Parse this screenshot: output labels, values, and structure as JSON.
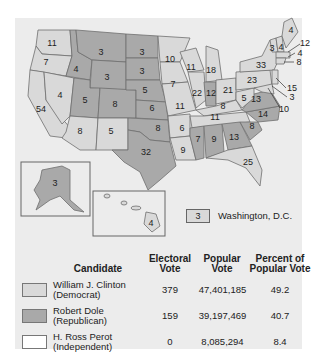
{
  "map": {
    "title": "1996 Presidential Election Electoral Votes",
    "colors": {
      "democrat": "#d9d9d9",
      "republican": "#a9a9a9",
      "independent": "#ffffff",
      "border": "#6e6e6e",
      "background": "#ececec"
    },
    "states": [
      {
        "abbr": "WA",
        "votes": "11",
        "party": "democrat"
      },
      {
        "abbr": "OR",
        "votes": "7",
        "party": "democrat"
      },
      {
        "abbr": "CA",
        "votes": "54",
        "party": "democrat"
      },
      {
        "abbr": "NV",
        "votes": "4",
        "party": "democrat"
      },
      {
        "abbr": "ID",
        "votes": "4",
        "party": "republican"
      },
      {
        "abbr": "MT",
        "votes": "3",
        "party": "republican"
      },
      {
        "abbr": "WY",
        "votes": "3",
        "party": "republican"
      },
      {
        "abbr": "UT",
        "votes": "5",
        "party": "republican"
      },
      {
        "abbr": "CO",
        "votes": "8",
        "party": "republican"
      },
      {
        "abbr": "AZ",
        "votes": "8",
        "party": "democrat"
      },
      {
        "abbr": "NM",
        "votes": "5",
        "party": "democrat"
      },
      {
        "abbr": "ND",
        "votes": "3",
        "party": "republican"
      },
      {
        "abbr": "SD",
        "votes": "3",
        "party": "republican"
      },
      {
        "abbr": "NE",
        "votes": "5",
        "party": "republican"
      },
      {
        "abbr": "KS",
        "votes": "6",
        "party": "republican"
      },
      {
        "abbr": "OK",
        "votes": "8",
        "party": "republican"
      },
      {
        "abbr": "TX",
        "votes": "32",
        "party": "republican"
      },
      {
        "abbr": "MN",
        "votes": "10",
        "party": "democrat"
      },
      {
        "abbr": "IA",
        "votes": "7",
        "party": "democrat"
      },
      {
        "abbr": "MO",
        "votes": "11",
        "party": "democrat"
      },
      {
        "abbr": "AR",
        "votes": "6",
        "party": "democrat"
      },
      {
        "abbr": "LA",
        "votes": "9",
        "party": "democrat"
      },
      {
        "abbr": "WI",
        "votes": "11",
        "party": "democrat"
      },
      {
        "abbr": "IL",
        "votes": "22",
        "party": "democrat"
      },
      {
        "abbr": "MI",
        "votes": "18",
        "party": "democrat"
      },
      {
        "abbr": "IN",
        "votes": "12",
        "party": "republican"
      },
      {
        "abbr": "OH",
        "votes": "21",
        "party": "democrat"
      },
      {
        "abbr": "KY",
        "votes": "8",
        "party": "democrat"
      },
      {
        "abbr": "TN",
        "votes": "11",
        "party": "democrat"
      },
      {
        "abbr": "MS",
        "votes": "7",
        "party": "republican"
      },
      {
        "abbr": "AL",
        "votes": "9",
        "party": "republican"
      },
      {
        "abbr": "GA",
        "votes": "13",
        "party": "republican"
      },
      {
        "abbr": "FL",
        "votes": "25",
        "party": "democrat"
      },
      {
        "abbr": "SC",
        "votes": "8",
        "party": "republican"
      },
      {
        "abbr": "NC",
        "votes": "14",
        "party": "republican"
      },
      {
        "abbr": "VA",
        "votes": "13",
        "party": "republican"
      },
      {
        "abbr": "WV",
        "votes": "5",
        "party": "democrat"
      },
      {
        "abbr": "PA",
        "votes": "23",
        "party": "democrat"
      },
      {
        "abbr": "NY",
        "votes": "33",
        "party": "democrat"
      },
      {
        "abbr": "VT",
        "votes": "3",
        "party": "democrat"
      },
      {
        "abbr": "NH",
        "votes": "4",
        "party": "democrat"
      },
      {
        "abbr": "ME",
        "votes": "4",
        "party": "democrat"
      },
      {
        "abbr": "MA",
        "votes": "12",
        "party": "democrat"
      },
      {
        "abbr": "RI",
        "votes": "4",
        "party": "democrat"
      },
      {
        "abbr": "CT",
        "votes": "8",
        "party": "democrat"
      },
      {
        "abbr": "NJ",
        "votes": "15",
        "party": "democrat"
      },
      {
        "abbr": "DE",
        "votes": "3",
        "party": "democrat"
      },
      {
        "abbr": "MD",
        "votes": "10",
        "party": "democrat"
      },
      {
        "abbr": "AK",
        "votes": "3",
        "party": "republican"
      },
      {
        "abbr": "HI",
        "votes": "4",
        "party": "democrat"
      }
    ],
    "dc": {
      "votes": "3",
      "label": "Washington, D.C.",
      "party": "democrat"
    }
  },
  "table": {
    "headers": {
      "candidate": "Candidate",
      "electoral_1": "Electoral",
      "electoral_2": "Vote",
      "popular_1": "Popular",
      "popular_2": "Vote",
      "percent_1": "Percent of",
      "percent_2": "Popular Vote"
    },
    "rows": [
      {
        "name": "William J. Clinton",
        "party": "(Democrat)",
        "electoral": "379",
        "popular": "47,401,185",
        "percent": "49.2",
        "color": "#d9d9d9"
      },
      {
        "name": "Robert Dole",
        "party": "(Republican)",
        "electoral": "159",
        "popular": "39,197,469",
        "percent": "40.7",
        "color": "#a9a9a9"
      },
      {
        "name": "H. Ross Perot",
        "party": "(Independent)",
        "electoral": "0",
        "popular": "8,085,294",
        "percent": "8.4",
        "color": "#ffffff"
      }
    ]
  }
}
